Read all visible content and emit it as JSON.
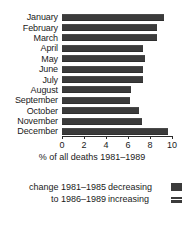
{
  "chart_data": {
    "type": "bar",
    "orientation": "horizontal",
    "title": "",
    "xlabel": "% of all deaths 1981–1989",
    "ylabel": "",
    "xlim": [
      0,
      10
    ],
    "grid": false,
    "categories": [
      "January",
      "February",
      "March",
      "April",
      "May",
      "June",
      "July",
      "August",
      "September",
      "October",
      "November",
      "December"
    ],
    "values": [
      9.3,
      8.6,
      8.6,
      7.4,
      7.5,
      7.4,
      7.4,
      6.3,
      6.2,
      7.0,
      7.3,
      9.6
    ],
    "tick_labels": [
      "0",
      "2",
      "4",
      "6",
      "8",
      "10"
    ],
    "tick_values": [
      0,
      2,
      4,
      6,
      8,
      10
    ],
    "legend": {
      "position": "bottom",
      "caption_lines": [
        "change 1981–1985",
        "to 1986–1989"
      ],
      "entries": [
        {
          "label": "decreasing",
          "swatch": "solid-dark",
          "color": "#3b3b3b"
        },
        {
          "label": "increasing",
          "swatch": "split-dark",
          "color": "#3b3b3b"
        }
      ]
    },
    "series_color": "#3b3b3b"
  }
}
